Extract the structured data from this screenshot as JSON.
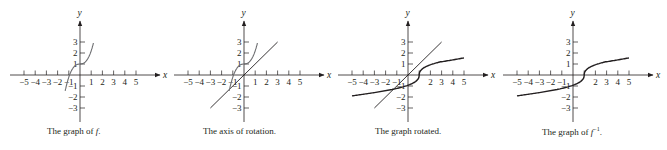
{
  "figure": {
    "panels": [
      {
        "id": "graph-of-f",
        "origin_px": [
          80,
          75
        ],
        "caption_parts": [
          "The graph of ",
          "f",
          "."
        ],
        "show_f": true,
        "show_line": false,
        "show_finv": false,
        "x_tick_labels_hidden": []
      },
      {
        "id": "axis-of-rotation",
        "origin_px": [
          244,
          75
        ],
        "caption_parts": [
          "The axis of rotation.",
          "",
          ""
        ],
        "show_f": true,
        "show_line": true,
        "show_finv": false,
        "x_tick_labels_hidden": []
      },
      {
        "id": "graph-rotated",
        "origin_px": [
          408,
          75
        ],
        "caption_parts": [
          "The graph rotated.",
          "",
          ""
        ],
        "show_f": false,
        "show_line": true,
        "show_finv": true,
        "x_tick_labels_hidden": [
          1
        ]
      },
      {
        "id": "graph-of-f-inverse",
        "origin_px": [
          573,
          75
        ],
        "caption_parts": [
          "The graph of ",
          "f",
          "−1",
          "."
        ],
        "show_f": false,
        "show_line": false,
        "show_finv": true,
        "x_tick_labels_hidden": [
          1
        ]
      }
    ],
    "axes": {
      "x_label": "x",
      "y_label": "y",
      "x_ticks": [
        -5,
        -4,
        -3,
        -2,
        -1,
        1,
        2,
        3,
        4,
        5
      ],
      "y_ticks": [
        3,
        2,
        1,
        -1,
        -2,
        -3
      ],
      "unit_px_x": 11.2,
      "unit_px_y": 11
    },
    "colors": {
      "ink": "#231f20",
      "curve_f": "#6d6e71",
      "curve_finv": "#231f20",
      "line_y_equals_x": "#231f20"
    }
  },
  "chart_data": [
    {
      "type": "line",
      "title": "The graph of f.",
      "xlabel": "x",
      "ylabel": "y",
      "xlim": [
        -5.5,
        6.5
      ],
      "ylim": [
        -4,
        5
      ],
      "x_ticks": [
        -5,
        -4,
        -3,
        -2,
        -1,
        1,
        2,
        3,
        4,
        5
      ],
      "y_ticks": [
        -3,
        -2,
        -1,
        1,
        2,
        3
      ],
      "series": [
        {
          "name": "f",
          "x": [
            -1.3,
            -1.1,
            -0.9,
            -0.6,
            -0.3,
            0,
            0.3,
            0.6,
            0.9,
            1.2
          ],
          "y": [
            -3,
            -1.6,
            -0.4,
            0.6,
            0.95,
            1,
            1.05,
            1.4,
            2.0,
            3
          ]
        }
      ]
    },
    {
      "type": "line",
      "title": "The axis of rotation.",
      "xlabel": "x",
      "ylabel": "y",
      "series": [
        {
          "name": "f",
          "x": [
            -1.3,
            -1.1,
            -0.9,
            -0.6,
            -0.3,
            0,
            0.3,
            0.6,
            0.9,
            1.2
          ],
          "y": [
            -3,
            -1.6,
            -0.4,
            0.6,
            0.95,
            1,
            1.05,
            1.4,
            2.0,
            3
          ]
        },
        {
          "name": "y = x",
          "x": [
            -3,
            3
          ],
          "y": [
            -3,
            3
          ]
        }
      ]
    },
    {
      "type": "line",
      "title": "The graph rotated.",
      "xlabel": "x",
      "ylabel": "y",
      "series": [
        {
          "name": "y = x",
          "x": [
            -3,
            3
          ],
          "y": [
            -3,
            3
          ]
        },
        {
          "name": "f^-1",
          "x": [
            -5,
            -3,
            -1.6,
            -0.4,
            0.6,
            0.95,
            1,
            1.05,
            1.4,
            2.0,
            3,
            5
          ],
          "y": [
            -1.9,
            -1.6,
            -1.1,
            -0.9,
            -0.6,
            -0.3,
            0,
            0.3,
            0.6,
            0.9,
            1.2,
            1.55
          ]
        }
      ]
    },
    {
      "type": "line",
      "title": "The graph of f^-1.",
      "xlabel": "x",
      "ylabel": "y",
      "series": [
        {
          "name": "f^-1",
          "x": [
            -5,
            -3,
            -1.6,
            -0.4,
            0.6,
            0.95,
            1,
            1.05,
            1.4,
            2.0,
            3,
            5
          ],
          "y": [
            -1.9,
            -1.6,
            -1.1,
            -0.9,
            -0.6,
            -0.3,
            0,
            0.3,
            0.6,
            0.9,
            1.2,
            1.55
          ]
        }
      ]
    }
  ]
}
